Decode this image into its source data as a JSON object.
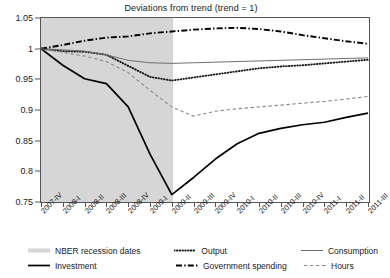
{
  "chart_data": {
    "type": "line",
    "title": "Deviations from trend (trend = 1)",
    "xlabel": "",
    "ylabel": "",
    "ylim": [
      0.75,
      1.05
    ],
    "ytick_step": 0.05,
    "yticks": [
      "0.75",
      "0.8",
      "0.85",
      "0.9",
      "0.95",
      "1",
      "1.05"
    ],
    "ytick_values": [
      0.75,
      0.8,
      0.85,
      0.9,
      0.95,
      1.0,
      1.05
    ],
    "grid": false,
    "legend_position": "bottom",
    "categories": [
      "2007-IV",
      "2008-I",
      "2008-II",
      "2008-III",
      "2008-IV",
      "2009-I",
      "2009-II",
      "2009-III",
      "2009-IV",
      "2010-I",
      "2010-II",
      "2010-III",
      "2010-IV",
      "2011-I",
      "2011-II",
      "2011-III"
    ],
    "shaded_region": {
      "label": "NBER recession dates",
      "start_category": "2007-IV",
      "end_category": "2009-II",
      "color": "#d6d6d6"
    },
    "series": [
      {
        "name": "Output",
        "style": "dotted",
        "color": "#1a1a1a",
        "values": [
          1.0,
          0.996,
          0.995,
          0.99,
          0.972,
          0.954,
          0.948,
          0.953,
          0.958,
          0.963,
          0.968,
          0.971,
          0.973,
          0.976,
          0.979,
          0.982
        ]
      },
      {
        "name": "Consumption",
        "style": "solid-thin",
        "color": "#6e6e6e",
        "values": [
          1.0,
          0.998,
          0.996,
          0.99,
          0.981,
          0.977,
          0.976,
          0.977,
          0.978,
          0.979,
          0.98,
          0.981,
          0.982,
          0.983,
          0.984,
          0.985
        ]
      },
      {
        "name": "Investment",
        "style": "solid-thick",
        "color": "#000000",
        "values": [
          1.0,
          0.973,
          0.951,
          0.943,
          0.905,
          0.828,
          0.762,
          0.79,
          0.82,
          0.845,
          0.862,
          0.87,
          0.876,
          0.88,
          0.888,
          0.895
        ]
      },
      {
        "name": "Government spending",
        "style": "dash-dot",
        "color": "#000000",
        "values": [
          1.0,
          1.006,
          1.013,
          1.018,
          1.02,
          1.025,
          1.028,
          1.031,
          1.033,
          1.034,
          1.032,
          1.028,
          1.022,
          1.017,
          1.012,
          1.008
        ]
      },
      {
        "name": "Hours",
        "style": "dashed",
        "color": "#8a8a8a",
        "values": [
          1.0,
          0.994,
          0.988,
          0.979,
          0.961,
          0.932,
          0.905,
          0.89,
          0.898,
          0.902,
          0.905,
          0.908,
          0.911,
          0.914,
          0.918,
          0.922
        ]
      }
    ]
  },
  "legend": {
    "rows": [
      [
        {
          "label": "NBER recession dates",
          "style": "band",
          "color": "#d6d6d6"
        },
        {
          "label": "Output",
          "style": "dotted",
          "color": "#1a1a1a"
        },
        {
          "label": "Consumption",
          "style": "solid-thin",
          "color": "#6e6e6e"
        }
      ],
      [
        {
          "label": "Investment",
          "style": "solid-thick",
          "color": "#000000"
        },
        {
          "label": "Government spending",
          "style": "dash-dot",
          "color": "#000000"
        },
        {
          "label": "Hours",
          "style": "dashed",
          "color": "#8a8a8a"
        }
      ]
    ]
  }
}
